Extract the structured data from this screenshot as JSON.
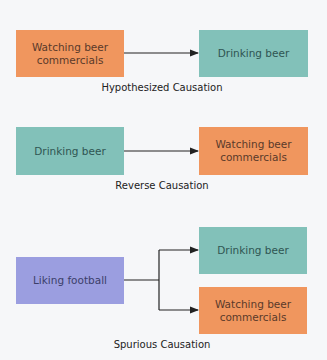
{
  "diagrams": [
    {
      "caption": "Hypothesized Causation",
      "from": {
        "label": "Watching beer commercials",
        "color": "#f0965e"
      },
      "to": [
        {
          "label": "Drinking beer",
          "color": "#82c1b9"
        }
      ]
    },
    {
      "caption": "Reverse Causation",
      "from": {
        "label": "Drinking beer",
        "color": "#82c1b9"
      },
      "to": [
        {
          "label": "Watching beer commercials",
          "color": "#f0965e"
        }
      ]
    },
    {
      "caption": "Spurious Causation",
      "from": {
        "label": "Liking football",
        "color": "#9b9ee0"
      },
      "to": [
        {
          "label": "Drinking beer",
          "color": "#82c1b9"
        },
        {
          "label": "Watching beer commercials",
          "color": "#f0965e"
        }
      ]
    }
  ]
}
